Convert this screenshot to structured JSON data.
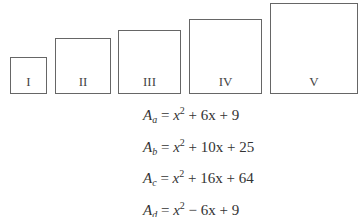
{
  "squares": [
    {
      "label": "I",
      "left": 10,
      "top": 57,
      "size": 36
    },
    {
      "label": "II",
      "left": 55,
      "top": 38,
      "size": 55
    },
    {
      "label": "III",
      "left": 118,
      "top": 30,
      "size": 63
    },
    {
      "label": "IV",
      "left": 189,
      "top": 19,
      "size": 73
    },
    {
      "label": "V",
      "left": 270,
      "top": 3,
      "size": 88
    }
  ],
  "equations": [
    {
      "var": "A",
      "sub": "a",
      "rhs_pre": "x",
      "exp": "2",
      "rhs_post": " + 6x + 9"
    },
    {
      "var": "A",
      "sub": "b",
      "rhs_pre": "x",
      "exp": "2",
      "rhs_post": " + 10x + 25"
    },
    {
      "var": "A",
      "sub": "c",
      "rhs_pre": "x",
      "exp": "2",
      "rhs_post": " + 16x + 64"
    },
    {
      "var": "A",
      "sub": "d",
      "rhs_pre": "x",
      "exp": "2",
      "rhs_post": " − 6x + 9"
    },
    {
      "var": "A",
      "sub": "e",
      "rhs_pre": "x",
      "exp": "2",
      "rhs_post": " + 12x + 36"
    }
  ]
}
